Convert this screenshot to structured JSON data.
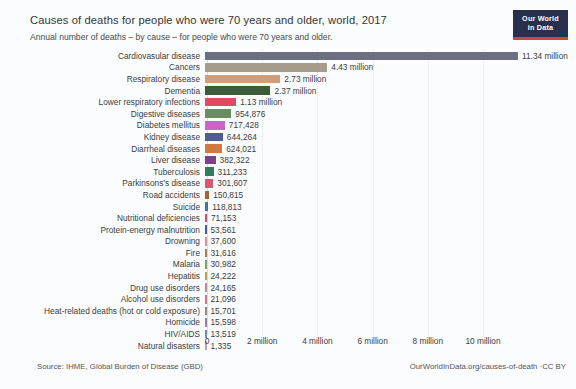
{
  "logo": {
    "line1": "Our World",
    "line2": "in Data"
  },
  "footer": {
    "source": "Source: IHME, Global Burden of Disease (GBD)",
    "license": "OurWorldInData.org/causes-of-death ·CC BY"
  },
  "chart_data": {
    "type": "bar",
    "orientation": "horizontal",
    "title": "Causes of deaths for people who were 70 years and older, world, 2017",
    "subtitle": "Annual number of deaths – by cause – for people who were 70 years and older.",
    "xlabel": "",
    "ylabel": "",
    "xlim": [
      0,
      11700000
    ],
    "grid": true,
    "legend": false,
    "tick_labels": [
      "0",
      "2 million",
      "4 million",
      "6 million",
      "8 million",
      "10 million"
    ],
    "tick_values": [
      0,
      2000000,
      4000000,
      6000000,
      8000000,
      10000000
    ],
    "categories": [
      "Cardiovasular disease",
      "Cancers",
      "Respiratory disease",
      "Dementia",
      "Lower respiratory infections",
      "Digestive diseases",
      "Diabetes mellitus",
      "Kidney disease",
      "Diarrheal diseases",
      "Liver disease",
      "Tuberculosis",
      "Parkinsons's disease",
      "Road accidents",
      "Suicide",
      "Nutritional deficiencies",
      "Protein-energy malnutrition",
      "Drowning",
      "Fire",
      "Malaria",
      "Hepatitis",
      "Drug use disorders",
      "Alcohol use disorders",
      "Heat-related deaths (hot or cold exposure)",
      "Homicide",
      "HIV/AIDS",
      "Natural disasters"
    ],
    "values": [
      11340000,
      4430000,
      2730000,
      2370000,
      1130000,
      954876,
      717428,
      644264,
      624021,
      382322,
      311233,
      301607,
      150815,
      118813,
      71153,
      53561,
      37600,
      31616,
      30982,
      24222,
      24165,
      21096,
      15701,
      15598,
      13519,
      1335
    ],
    "value_labels": [
      "11.34 million",
      "4.43 million",
      "2.73 million",
      "2.37 million",
      "1.13 million",
      "954,876",
      "717,428",
      "644,264",
      "624,021",
      "382,322",
      "311,233",
      "301,607",
      "150,815",
      "118,813",
      "71,153",
      "53,561",
      "37,600",
      "31,616",
      "30,982",
      "24,222",
      "24,165",
      "21,096",
      "15,701",
      "15,598",
      "13,519",
      "1,335"
    ],
    "colors": [
      "#6b6f80",
      "#a79b8e",
      "#cf9f7c",
      "#3c5b3b",
      "#e04a63",
      "#6b8b62",
      "#c965c9",
      "#4e5d93",
      "#cf7a43",
      "#7b3f8c",
      "#2f7d5c",
      "#e0556f",
      "#a8623a",
      "#4a6fa5",
      "#e0456b",
      "#4a5a9e",
      "#d98fa3",
      "#b07a52",
      "#7fa06a",
      "#b8a05c",
      "#b98f9e",
      "#d4738c",
      "#8c8c8c",
      "#9b7fa8",
      "#6f8fae",
      "#a8a8a8"
    ]
  }
}
